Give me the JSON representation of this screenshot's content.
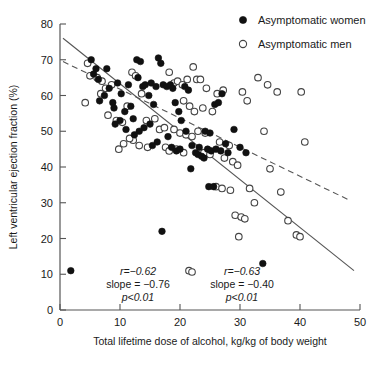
{
  "chart_data": {
    "type": "scatter",
    "title": "",
    "xlabel": "Total lifetime dose of alcohol, kg/kg of body weight",
    "ylabel": "Left ventricular ejection fraction (%)",
    "xlim": [
      0,
      50
    ],
    "ylim": [
      0,
      80
    ],
    "xticks": [
      0,
      10,
      20,
      30,
      40,
      50
    ],
    "yticks": [
      0,
      10,
      20,
      30,
      40,
      50,
      60,
      70,
      80
    ],
    "grid": false,
    "legend_position": "top-right",
    "series": [
      {
        "name": "Asymptomatic women",
        "marker": "filled-circle",
        "color": "#111111",
        "points": [
          [
            1.8,
            11.0
          ],
          [
            5.2,
            70.0
          ],
          [
            6.0,
            67.5
          ],
          [
            5.6,
            66.0
          ],
          [
            6.4,
            64.5
          ],
          [
            7.8,
            67.5
          ],
          [
            8.2,
            62.0
          ],
          [
            7.4,
            60.0
          ],
          [
            6.6,
            58.5
          ],
          [
            8.8,
            58.0
          ],
          [
            9.6,
            63.5
          ],
          [
            9.0,
            56.5
          ],
          [
            10.2,
            60.5
          ],
          [
            10.8,
            55.5
          ],
          [
            11.4,
            63.0
          ],
          [
            11.8,
            57.0
          ],
          [
            12.2,
            53.5
          ],
          [
            12.8,
            70.0
          ],
          [
            13.4,
            69.5
          ],
          [
            13.0,
            65.0
          ],
          [
            13.8,
            62.5
          ],
          [
            14.2,
            63.0
          ],
          [
            14.8,
            60.0
          ],
          [
            15.2,
            63.5
          ],
          [
            15.6,
            57.5
          ],
          [
            16.0,
            62.5
          ],
          [
            16.4,
            70.5
          ],
          [
            16.8,
            69.0
          ],
          [
            17.2,
            63.0
          ],
          [
            15.0,
            52.0
          ],
          [
            14.0,
            51.0
          ],
          [
            13.2,
            50.0
          ],
          [
            12.4,
            49.0
          ],
          [
            11.0,
            50.5
          ],
          [
            10.0,
            53.0
          ],
          [
            9.2,
            52.0
          ],
          [
            17.8,
            62.5
          ],
          [
            18.4,
            63.0
          ],
          [
            18.8,
            62.0
          ],
          [
            19.2,
            58.0
          ],
          [
            19.8,
            55.5
          ],
          [
            20.2,
            53.0
          ],
          [
            20.8,
            62.5
          ],
          [
            21.4,
            61.5
          ],
          [
            21.0,
            50.0
          ],
          [
            17.0,
            22.0
          ],
          [
            16.2,
            47.0
          ],
          [
            15.4,
            46.0
          ],
          [
            18.0,
            48.5
          ],
          [
            18.6,
            45.5
          ],
          [
            19.4,
            44.5
          ],
          [
            20.0,
            45.0
          ],
          [
            22.0,
            46.0
          ],
          [
            22.6,
            44.0
          ],
          [
            23.0,
            43.5
          ],
          [
            23.6,
            43.0
          ],
          [
            24.0,
            42.5
          ],
          [
            21.8,
            39.5
          ],
          [
            23.2,
            45.5
          ],
          [
            24.6,
            45.0
          ],
          [
            25.2,
            44.5
          ],
          [
            25.8,
            57.5
          ],
          [
            26.4,
            58.0
          ],
          [
            27.0,
            60.5
          ],
          [
            24.2,
            50.0
          ],
          [
            25.0,
            49.5
          ],
          [
            26.0,
            45.0
          ],
          [
            26.8,
            44.5
          ],
          [
            28.0,
            44.0
          ],
          [
            27.6,
            46.5
          ],
          [
            29.0,
            50.5
          ],
          [
            30.0,
            45.5
          ],
          [
            31.0,
            44.0
          ],
          [
            24.8,
            34.5
          ],
          [
            25.6,
            34.5
          ],
          [
            33.8,
            13.0
          ]
        ]
      },
      {
        "name": "Asymptomatic men",
        "marker": "open-circle",
        "color": "#444444",
        "points": [
          [
            21.5,
            11.0
          ],
          [
            4.6,
            69.0
          ],
          [
            5.0,
            65.5
          ],
          [
            6.2,
            65.0
          ],
          [
            4.2,
            58.0
          ],
          [
            7.0,
            64.0
          ],
          [
            8.0,
            54.5
          ],
          [
            9.4,
            53.0
          ],
          [
            10.4,
            52.5
          ],
          [
            11.2,
            57.0
          ],
          [
            12.0,
            66.5
          ],
          [
            12.6,
            65.5
          ],
          [
            13.6,
            60.5
          ],
          [
            14.4,
            53.0
          ],
          [
            15.8,
            53.5
          ],
          [
            16.6,
            50.5
          ],
          [
            17.4,
            51.0
          ],
          [
            13.2,
            46.0
          ],
          [
            14.6,
            45.5
          ],
          [
            12.2,
            47.5
          ],
          [
            11.6,
            48.0
          ],
          [
            10.6,
            46.5
          ],
          [
            9.8,
            45.0
          ],
          [
            18.2,
            66.5
          ],
          [
            19.0,
            63.5
          ],
          [
            19.6,
            64.0
          ],
          [
            20.4,
            63.0
          ],
          [
            21.2,
            64.5
          ],
          [
            22.2,
            68.0
          ],
          [
            22.8,
            64.5
          ],
          [
            23.4,
            64.5
          ],
          [
            24.4,
            62.0
          ],
          [
            20.6,
            58.5
          ],
          [
            21.6,
            57.0
          ],
          [
            22.4,
            55.5
          ],
          [
            23.8,
            56.5
          ],
          [
            19.0,
            50.5
          ],
          [
            20.0,
            49.5
          ],
          [
            21.0,
            49.0
          ],
          [
            22.0,
            48.5
          ],
          [
            17.6,
            45.5
          ],
          [
            18.2,
            44.5
          ],
          [
            19.4,
            45.0
          ],
          [
            20.6,
            44.0
          ],
          [
            23.0,
            50.0
          ],
          [
            24.2,
            49.5
          ],
          [
            25.4,
            55.5
          ],
          [
            26.2,
            60.5
          ],
          [
            27.2,
            61.5
          ],
          [
            24.0,
            44.0
          ],
          [
            25.0,
            43.5
          ],
          [
            26.6,
            47.0
          ],
          [
            28.2,
            46.0
          ],
          [
            27.4,
            42.5
          ],
          [
            28.8,
            41.5
          ],
          [
            29.6,
            40.5
          ],
          [
            26.0,
            34.5
          ],
          [
            27.0,
            34.0
          ],
          [
            28.4,
            33.5
          ],
          [
            29.2,
            26.5
          ],
          [
            30.2,
            26.0
          ],
          [
            30.8,
            25.5
          ],
          [
            29.8,
            20.5
          ],
          [
            31.6,
            34.0
          ],
          [
            32.4,
            30.0
          ],
          [
            30.4,
            61.0
          ],
          [
            31.2,
            58.5
          ],
          [
            33.0,
            65.0
          ],
          [
            34.6,
            63.0
          ],
          [
            36.2,
            61.0
          ],
          [
            34.0,
            50.0
          ],
          [
            35.0,
            39.5
          ],
          [
            36.8,
            33.0
          ],
          [
            38.0,
            25.0
          ],
          [
            39.4,
            21.0
          ],
          [
            40.2,
            61.0
          ],
          [
            40.8,
            47.0
          ],
          [
            40.0,
            20.5
          ],
          [
            8.6,
            63.0
          ],
          [
            7.6,
            62.0
          ],
          [
            6.8,
            60.5
          ]
        ]
      }
    ],
    "fit_lines": [
      {
        "name": "women-regression-line",
        "style": "solid",
        "x": [
          0.5,
          49.0
        ],
        "y": [
          76.0,
          11.0
        ]
      },
      {
        "name": "men-regression-line",
        "style": "dashed",
        "x": [
          0.5,
          48.5
        ],
        "y": [
          69.5,
          30.5
        ]
      }
    ],
    "annotations": [
      {
        "id": "women-stats",
        "marker": "filled-circle",
        "lines": [
          "r=−0.62",
          "slope = −0.76",
          "p<0.01"
        ]
      },
      {
        "id": "men-stats",
        "marker": "open-circle",
        "lines": [
          "r=−0.63",
          "slope = −0.40",
          "p<0.01"
        ]
      }
    ],
    "legend": [
      {
        "label": "Asymptomatic women",
        "marker": "filled-circle"
      },
      {
        "label": "Asymptomatic men",
        "marker": "open-circle"
      }
    ]
  }
}
